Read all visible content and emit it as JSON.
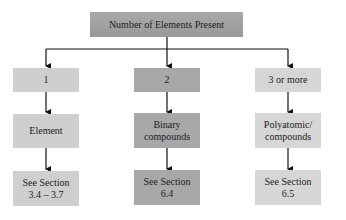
{
  "root": {
    "label": "Number of Elements Present"
  },
  "columns": [
    {
      "count": "1",
      "type": "Element",
      "reference": "See Section\n3.4–3.7",
      "ref_line1": "See Section",
      "ref_line2": "3.4 – 3.7"
    },
    {
      "count": "2",
      "type_line1": "Binary",
      "type_line2": "compounds",
      "ref_line1": "See Section",
      "ref_line2": "6.4"
    },
    {
      "count": "3 or more",
      "type_line1": "Polyatomic/",
      "type_line2": "compounds",
      "ref_line1": "See Section",
      "ref_line2": "6.5"
    }
  ],
  "colors": {
    "top": "#a0a0a0",
    "col1": "#cfcfcf",
    "col2": "#a8a8a8",
    "col3": "#d6d6d6",
    "line": "#111111"
  }
}
